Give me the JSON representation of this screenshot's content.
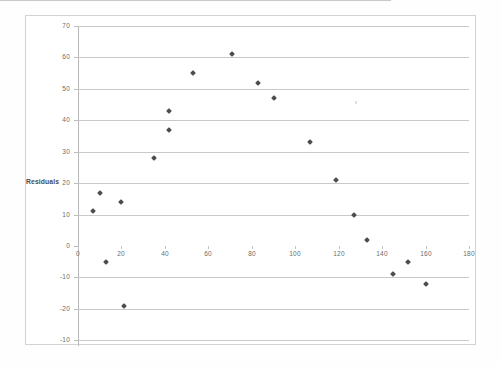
{
  "chart_data": {
    "type": "scatter",
    "title": "",
    "xlabel": "",
    "ylabel": "Residuals",
    "xlim": [
      0,
      180
    ],
    "ylim": [
      -30,
      70
    ],
    "xticks": [
      0,
      20,
      40,
      60,
      80,
      100,
      120,
      140,
      160,
      180
    ],
    "yticks": [
      70,
      60,
      50,
      40,
      30,
      20,
      10,
      0,
      -10,
      -20,
      -30
    ],
    "ytick_labels": [
      "70",
      "60",
      "50",
      "40",
      "30",
      "20",
      "10",
      "0",
      "-10",
      "-20",
      "-10"
    ],
    "xtick_labels": [
      "0",
      "20",
      "40",
      "60",
      "80",
      "100",
      "120",
      "140",
      "160",
      "180"
    ],
    "grid": "horizontal",
    "legend": "none",
    "marker": "diamond",
    "marker_color": "#4d4d4d",
    "points": [
      {
        "x": 7,
        "y": 11
      },
      {
        "x": 10,
        "y": 17
      },
      {
        "x": 13,
        "y": -5
      },
      {
        "x": 20,
        "y": 14
      },
      {
        "x": 21,
        "y": -19
      },
      {
        "x": 35,
        "y": 28
      },
      {
        "x": 42,
        "y": 43
      },
      {
        "x": 42,
        "y": 37
      },
      {
        "x": 53,
        "y": 55
      },
      {
        "x": 71,
        "y": 61
      },
      {
        "x": 83,
        "y": 52
      },
      {
        "x": 90,
        "y": 47
      },
      {
        "x": 107,
        "y": 33
      },
      {
        "x": 119,
        "y": 21
      },
      {
        "x": 127,
        "y": 10
      },
      {
        "x": 133,
        "y": 2
      },
      {
        "x": 145,
        "y": -9
      },
      {
        "x": 152,
        "y": -5
      },
      {
        "x": 160,
        "y": -12
      }
    ]
  },
  "axis": {
    "y_title": "Residuals"
  }
}
